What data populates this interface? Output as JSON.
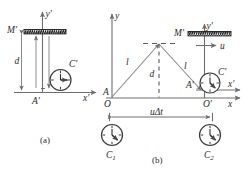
{
  "figure": {
    "panels": [
      {
        "id": "a",
        "caption": "(a)",
        "labels": {
          "y_axis": "y'",
          "x_axis": "x'",
          "mirror": "M'",
          "distance": "d",
          "clock": "C'",
          "origin": "A'"
        }
      },
      {
        "id": "b",
        "caption": "(b)",
        "labels": {
          "y_axis": "y",
          "x_axis": "x",
          "y_axis_primed": "y'",
          "x_axis_primed": "x'",
          "mirror": "M'",
          "velocity": "u",
          "distance": "d",
          "left_leg": "l",
          "right_leg": "l",
          "origin": "O",
          "origin_primed": "O'",
          "point_A": "A",
          "point_A_primed": "A'",
          "clock_moving": "C'",
          "clock_1": "C",
          "clock_1_sub": "1",
          "clock_2": "C",
          "clock_2_sub": "2",
          "displacement": "uΔt"
        }
      }
    ],
    "colors": {
      "ink": "#2b2b2b",
      "line": "#6e6e6e",
      "mirror_fill": "#1a1a1a",
      "background": "#ffffff"
    }
  }
}
